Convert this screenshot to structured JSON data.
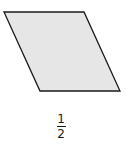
{
  "figure": {
    "shape": "parallelogram",
    "fill": "#e6e6e6",
    "stroke": "#1a1a1a",
    "points": "4,12 84,12 120,91 40,91"
  },
  "label": {
    "numerator": "1",
    "denominator": "2"
  }
}
